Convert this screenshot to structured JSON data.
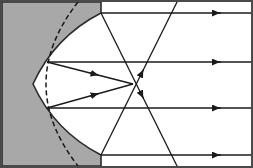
{
  "figure": {
    "width": 253,
    "height": 168,
    "background_color": "#ffffff",
    "border_color": "#4a4a4a",
    "border_width": 2
  },
  "mirror": {
    "name": "concave spherical mirror",
    "fill_color": "#a8a8a8",
    "edge_color": "#2b2b2b",
    "edge_width": 1.6,
    "vertex": {
      "x": 33,
      "y": 84
    },
    "center_of_curvature": {
      "x": 183,
      "y": 84
    },
    "radius": 150,
    "aperture_half_angle_deg": 48,
    "rim_top": {
      "x": 101,
      "y": 13
    },
    "rim_bottom": {
      "x": 101,
      "y": 155
    },
    "path": "M 2 2 L 101 2 L 101 13 A 150 150 0 0 0 33 84 A 150 150 0 0 0 101 155 L 101 166 L 2 166 Z"
  },
  "parabola": {
    "name": "ideal parabola (dashed reference curve)",
    "stroke_color": "#1a1a1a",
    "stroke_width": 1.5,
    "dash_pattern": "5,3",
    "vertex": {
      "x": 46,
      "y": 84
    },
    "focus": {
      "x": 133,
      "y": 84
    },
    "path": "M 78 2 Q 46 43 46 84 Q 46 125 78 166"
  },
  "focus_point": {
    "name": "paraxial focus",
    "x": 133,
    "y": 84,
    "label": "F"
  },
  "incident_rays": {
    "name": "incoming parallel rays",
    "color": "#1a1a1a",
    "width": 1.3,
    "direction": "right-to-left",
    "arrow_label": "left-pointing arrowhead",
    "rays": [
      {
        "id": "ray-1-outer-top",
        "y": 13,
        "x_start": 251,
        "x_end": 101,
        "arrow_x": 212
      },
      {
        "id": "ray-2-inner-top",
        "y": 62,
        "x_start": 251,
        "x_end": 47,
        "arrow_x": 212
      },
      {
        "id": "ray-3-inner-bottom",
        "y": 108,
        "x_start": 251,
        "x_end": 47,
        "arrow_x": 212
      },
      {
        "id": "ray-4-outer-bottom",
        "y": 155,
        "x_start": 251,
        "x_end": 101,
        "arrow_x": 212
      }
    ]
  },
  "reflected_rays": {
    "name": "reflected rays after striking the mirror",
    "color": "#1a1a1a",
    "width": 1.3,
    "rays": [
      {
        "id": "reflect-outer-top",
        "from": {
          "x": 101,
          "y": 13
        },
        "to": {
          "x": 178,
          "y": 168
        },
        "arrow_t": 0.55,
        "note": "outer top ray crosses axis short of the focus"
      },
      {
        "id": "reflect-inner-top",
        "from": {
          "x": 47,
          "y": 62
        },
        "to": {
          "x": 133,
          "y": 84
        },
        "arrow_t": 0.6,
        "note": "inner top ray converges to the paraxial focus"
      },
      {
        "id": "reflect-inner-bottom",
        "from": {
          "x": 47,
          "y": 108
        },
        "to": {
          "x": 133,
          "y": 84
        },
        "arrow_t": 0.6,
        "note": "inner bottom ray converges to the paraxial focus"
      },
      {
        "id": "reflect-outer-bottom",
        "from": {
          "x": 101,
          "y": 155
        },
        "to": {
          "x": 178,
          "y": 0
        },
        "arrow_t": 0.55,
        "note": "outer bottom ray crosses axis short of the focus"
      }
    ]
  },
  "axis": {
    "name": "optical axis",
    "y": 84,
    "visible": false
  }
}
